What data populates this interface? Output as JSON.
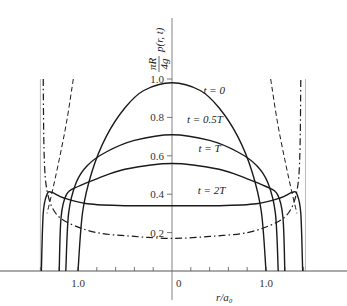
{
  "chart_data": {
    "type": "line",
    "title": "",
    "xlabel": "r/a₀",
    "ylabel": "πR/4g p(r, t)",
    "ylabel_parts": {
      "numerator": "πR",
      "denominator": "4g",
      "expr": "p(r, t)"
    },
    "xlim": [
      -1.48,
      1.85
    ],
    "ylim": [
      0,
      1.2
    ],
    "grid": false,
    "legend": "inline labels",
    "x_tick_labels": [
      {
        "value": -1.0,
        "label": "1.0"
      },
      {
        "value": 0,
        "label": "0"
      },
      {
        "value": 1.0,
        "label": "1.0"
      }
    ],
    "x_minor_ticks": [
      -1.4,
      -1.2,
      -1.0,
      -0.8,
      -0.6,
      -0.4,
      -0.2,
      0.2,
      0.4,
      0.6,
      0.8,
      1.0,
      1.2,
      1.4
    ],
    "y_tick_labels": [
      {
        "value": 0.2,
        "label": "0.2"
      },
      {
        "value": 0.4,
        "label": "0.4"
      },
      {
        "value": 0.6,
        "label": "0.6"
      },
      {
        "value": 0.8,
        "label": "0.8"
      },
      {
        "value": 1.0,
        "label": "1.0"
      }
    ],
    "series": [
      {
        "name": "t = 0",
        "style": "solid",
        "label_pos": [
          0.45,
          0.92
        ],
        "x": [
          -1.0,
          -0.95,
          -0.85,
          -0.7,
          -0.5,
          -0.3,
          0,
          0.3,
          0.5,
          0.7,
          0.85,
          0.95,
          1.0
        ],
        "y": [
          0.0,
          0.31,
          0.52,
          0.7,
          0.85,
          0.94,
          0.98,
          0.94,
          0.85,
          0.7,
          0.52,
          0.31,
          0.0
        ]
      },
      {
        "name": "t = 0.5T",
        "style": "solid",
        "label_pos": [
          0.35,
          0.77
        ],
        "x": [
          -1.13,
          -1.1,
          -1.02,
          -0.9,
          -0.7,
          -0.4,
          0,
          0.4,
          0.7,
          0.9,
          1.02,
          1.1,
          1.13
        ],
        "y": [
          0.0,
          0.3,
          0.46,
          0.55,
          0.62,
          0.68,
          0.71,
          0.68,
          0.62,
          0.55,
          0.46,
          0.3,
          0.0
        ]
      },
      {
        "name": "t = T",
        "style": "solid",
        "label_pos": [
          0.4,
          0.62
        ],
        "x": [
          -1.2,
          -1.18,
          -1.12,
          -1.0,
          -0.8,
          -0.5,
          0,
          0.5,
          0.8,
          1.0,
          1.12,
          1.18,
          1.2
        ],
        "y": [
          0.0,
          0.28,
          0.4,
          0.44,
          0.48,
          0.53,
          0.56,
          0.53,
          0.48,
          0.44,
          0.4,
          0.28,
          0.0
        ]
      },
      {
        "name": "t = 2T",
        "style": "solid",
        "label_pos": [
          0.42,
          0.4
        ],
        "x": [
          -1.39,
          -1.37,
          -1.33,
          -1.28,
          -1.15,
          -0.9,
          -0.5,
          0,
          0.5,
          0.9,
          1.15,
          1.28,
          1.33,
          1.37,
          1.39
        ],
        "y": [
          0.0,
          0.3,
          0.4,
          0.41,
          0.38,
          0.35,
          0.34,
          0.34,
          0.34,
          0.35,
          0.38,
          0.41,
          0.4,
          0.3,
          0.0
        ]
      },
      {
        "name": "steady-state (dash-dot)",
        "style": "dashdot",
        "x": [
          -1.37,
          -1.36,
          -1.33,
          -1.25,
          -1.1,
          -0.8,
          -0.4,
          0,
          0.4,
          0.8,
          1.1,
          1.25,
          1.33,
          1.36,
          1.37
        ],
        "y": [
          1.0,
          0.6,
          0.42,
          0.31,
          0.25,
          0.2,
          0.18,
          0.17,
          0.18,
          0.2,
          0.25,
          0.31,
          0.42,
          0.6,
          1.0
        ]
      },
      {
        "name": "dashed",
        "style": "dashed",
        "x": [
          -1.05,
          -1.12,
          -1.2,
          -1.28,
          -1.33
        ],
        "y": [
          1.0,
          0.78,
          0.58,
          0.4,
          0.3
        ]
      },
      {
        "name": "dashed (right)",
        "style": "dashed",
        "x": [
          1.05,
          1.12,
          1.2,
          1.28,
          1.33
        ],
        "y": [
          1.0,
          0.78,
          0.58,
          0.4,
          0.3
        ]
      }
    ],
    "asymptotes_x": [
      -1.4,
      1.42
    ]
  }
}
